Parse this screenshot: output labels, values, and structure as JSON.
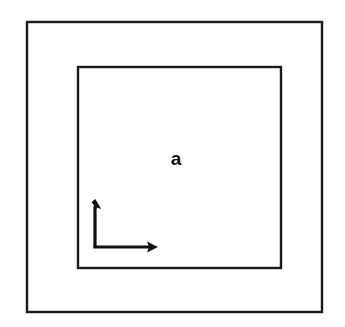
{
  "figure": {
    "background_color": "#ffffff",
    "line_color": "#1a1a1a",
    "canvas": {
      "width": 345,
      "height": 327
    }
  },
  "outer_boundary": {
    "name": "outer-rectangle",
    "x": 27,
    "y": 22,
    "width": 295,
    "height": 290,
    "stroke_width": 2.4,
    "stroke_color": "#1a1a1a"
  },
  "inner_boundary": {
    "name": "inner-rectangle",
    "x": 78,
    "y": 67,
    "width": 203,
    "height": 201,
    "stroke_width": 2.4,
    "stroke_color": "#1a1a1a"
  },
  "labels": {
    "region": "a"
  },
  "label_positions": {
    "region_x": 176,
    "region_y": 165
  },
  "axes": {
    "origin_x": 95,
    "origin_y": 247,
    "vertical_tip_y": 200,
    "horizontal_tip_x": 158,
    "stroke_color": "#111111",
    "stroke_width": 3.2,
    "arrow_fill": "#111111"
  }
}
